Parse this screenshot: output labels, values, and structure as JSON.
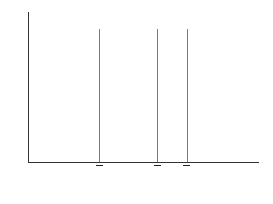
{
  "chart_data": {
    "type": "line",
    "title": "",
    "xlabel": "Score on Y",
    "ylabel": "Frequency",
    "series": [
      {
        "name": "K1",
        "mean_label": "Y1",
        "center_px": 99,
        "left_px": 36,
        "right_px": 160
      },
      {
        "name": "K2",
        "mean_label": "Y2",
        "center_px": 157,
        "left_px": 95,
        "right_px": 220
      },
      {
        "name": "K3",
        "mean_label": "Y3",
        "center_px": 187,
        "left_px": 124,
        "right_px": 250
      }
    ],
    "annotations": [
      "K1",
      "K2",
      "K3",
      "Ȳ1",
      "Ȳ2",
      "Ȳ3"
    ]
  },
  "labels": {
    "xlabel": "Score on ",
    "xvar": "Y",
    "ylabel": "Frequency",
    "k": "K",
    "y": "Y",
    "s1": "1",
    "s2": "2",
    "s3": "3"
  }
}
